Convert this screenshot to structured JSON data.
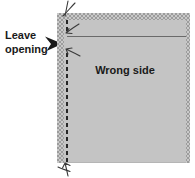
{
  "diagram": {
    "labels": {
      "leave_opening": "Leave opening",
      "wrong_side": "Wrong side"
    }
  },
  "colors": {
    "background": "#ffffff",
    "fabric_fill": "#c4c4c4",
    "texture_dark": "#9c9c9c",
    "texture_light": "#c9c9c9",
    "stitch_line": "#262626",
    "seam_line": "#6a6a6a",
    "thread": "#3a3a3a",
    "arrow": "#1a1a1a",
    "text": "#1a1a1a"
  }
}
